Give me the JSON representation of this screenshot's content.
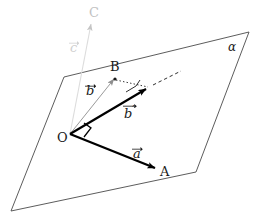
{
  "figure": {
    "plane_label": "α",
    "points": [
      {
        "name": "O",
        "label": "O",
        "x": 70,
        "y": 134
      },
      {
        "name": "A",
        "label": "A",
        "x": 160,
        "y": 171
      },
      {
        "name": "B",
        "label": "B",
        "x": 115,
        "y": 73
      },
      {
        "name": "C",
        "label": "C",
        "x": 93,
        "y": 18
      }
    ],
    "vectors": [
      {
        "name": "a",
        "label": "a",
        "prime": false,
        "color": "#000000",
        "style": "solid-bold",
        "from": "O",
        "to": "A"
      },
      {
        "name": "b",
        "label": "b",
        "prime": false,
        "color": "#9a9a9a",
        "style": "solid-thin",
        "from": "O",
        "to": "B"
      },
      {
        "name": "b-prime",
        "label": "b",
        "prime": true,
        "color": "#000000",
        "style": "solid-bold",
        "from": "O",
        "to": "Bprime"
      },
      {
        "name": "c",
        "label": "c",
        "prime": false,
        "color": "#d8d8d8",
        "style": "solid-thin",
        "from": "O",
        "to": "C"
      }
    ],
    "vector_labels": [
      {
        "name": "a",
        "text": "a",
        "prime": false,
        "x": 133,
        "y": 149,
        "faint": false
      },
      {
        "name": "b",
        "text": "b",
        "prime": false,
        "x": 86,
        "y": 84,
        "faint": false
      },
      {
        "name": "b-prime",
        "text": "b",
        "prime": true,
        "x": 124,
        "y": 104,
        "faint": false
      },
      {
        "name": "c",
        "text": "c",
        "prime": false,
        "x": 70,
        "y": 40,
        "faint": true
      }
    ],
    "right_angles": [
      {
        "name": "right-angle-at-O",
        "at": "O"
      },
      {
        "name": "right-angle-at-Bprime",
        "at": "Bprime"
      }
    ],
    "dotted_segment": {
      "name": "B-to-Bprime-dropline",
      "from": "B",
      "to": "Bprime"
    },
    "dashed_ray": {
      "name": "extension-ray",
      "from": "Bprime",
      "to": [
        181,
        71
      ]
    },
    "plane_polygon": [
      [
        64,
        77
      ],
      [
        249,
        32
      ],
      [
        196,
        172
      ],
      [
        11,
        211
      ]
    ],
    "colors": {
      "ink": "#1a1a1a",
      "line": "#555555",
      "faint": "#d8d8d8",
      "gray": "#9a9a9a",
      "background": "#ffffff"
    }
  }
}
